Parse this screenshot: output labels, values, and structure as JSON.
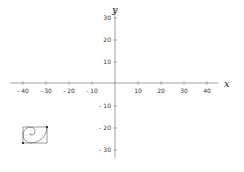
{
  "axes": {
    "x_label": "x",
    "y_label": "y",
    "x_ticks": [
      {
        "value": -40,
        "label": "- 40"
      },
      {
        "value": -30,
        "label": "- 30"
      },
      {
        "value": -20,
        "label": "- 20"
      },
      {
        "value": -10,
        "label": "- 10"
      },
      {
        "value": 10,
        "label": "10"
      },
      {
        "value": 20,
        "label": "20"
      },
      {
        "value": 30,
        "label": "30"
      },
      {
        "value": 40,
        "label": "40"
      }
    ],
    "y_ticks": [
      {
        "value": 30,
        "label": "30"
      },
      {
        "value": 20,
        "label": "20"
      },
      {
        "value": 10,
        "label": "10"
      },
      {
        "value": -10,
        "label": "- 10"
      },
      {
        "value": -20,
        "label": "- 20"
      },
      {
        "value": -30,
        "label": "- 30"
      }
    ]
  },
  "figure": {
    "type": "golden-rectangle-spiral",
    "corner_points": [
      {
        "name": "top-right",
        "x": -30,
        "y": -20
      },
      {
        "name": "bottom-left",
        "x": -40,
        "y": -27
      }
    ]
  },
  "colors": {
    "axis": "#555555",
    "figure": "#444444",
    "point": "#111111"
  }
}
